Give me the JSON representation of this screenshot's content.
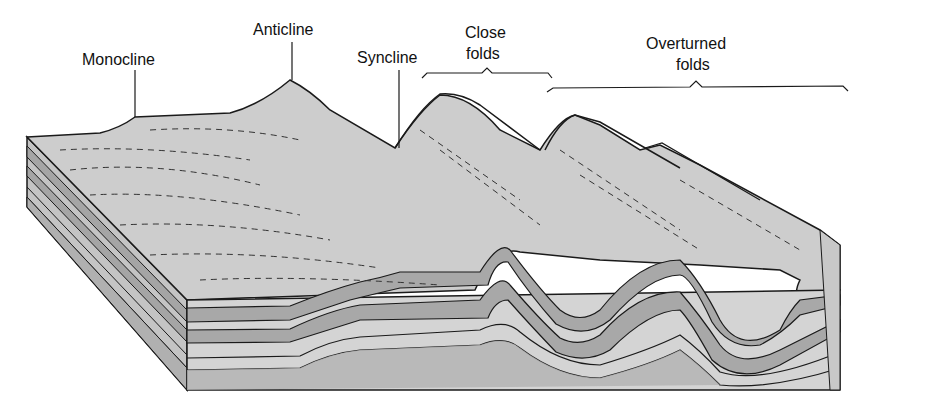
{
  "diagram": {
    "labels": {
      "monocline": "Monocline",
      "anticline": "Anticline",
      "syncline": "Syncline",
      "close_folds_line1": "Close",
      "close_folds_line2": "folds",
      "overturned_folds_line1": "Overturned",
      "overturned_folds_line2": "folds"
    },
    "colors": {
      "surface": "#cfcfcf",
      "dark_layer": "#a9a9a9",
      "light_layer": "#d6d6d6",
      "outline": "#1a1a1a",
      "background": "#ffffff"
    }
  }
}
